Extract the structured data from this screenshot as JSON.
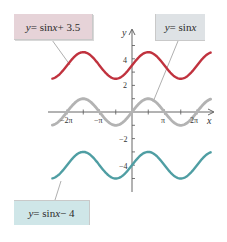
{
  "chart_data": {
    "type": "line",
    "title": "",
    "xlabel": "x",
    "ylabel": "y",
    "x_ticks": [
      "-2π",
      "-π",
      "π",
      "2π"
    ],
    "y_ticks": [
      "4",
      "2",
      "-2",
      "-4"
    ],
    "xlim": [
      -7.85,
      7.6
    ],
    "ylim": [
      -5,
      5
    ],
    "grid": false,
    "series": [
      {
        "name": "y = sin x + 3.5",
        "function": "sin(x) + 3.5",
        "vertical_shift": 3.5,
        "color": "#c0323e"
      },
      {
        "name": "y = sin x",
        "function": "sin(x)",
        "vertical_shift": 0,
        "color": "#b3b3b3"
      },
      {
        "name": "y = sin x − 4",
        "function": "sin(x) - 4",
        "vertical_shift": -4,
        "color": "#4f9ea3"
      }
    ]
  },
  "labels": {
    "top_left": {
      "lhs": "y",
      "eq": " = sin ",
      "var": "x",
      "rest": " + 3.5"
    },
    "top_right": {
      "lhs": "y",
      "eq": " = sin ",
      "var": "x",
      "rest": ""
    },
    "bottom_left": {
      "lhs": "y",
      "eq": " = sin ",
      "var": "x",
      "rest": " − 4"
    }
  },
  "axes": {
    "x_label": "x",
    "y_label": "y",
    "x_tick_labels": [
      "−2π",
      "−π",
      "π",
      "2π"
    ],
    "y_tick_labels": [
      "4",
      "2",
      "−2",
      "−4"
    ]
  }
}
